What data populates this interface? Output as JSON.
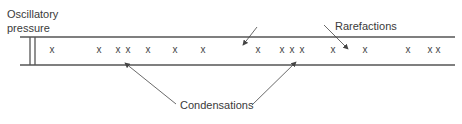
{
  "labels": {
    "source_line1": "Oscillatory",
    "source_line2": "pressure",
    "rarefactions": "Rarefactions",
    "condensations": "Condensations"
  },
  "particles": {
    "glyph": "x",
    "x_positions": [
      52,
      99,
      118,
      128,
      148,
      175,
      203,
      258,
      282,
      292,
      302,
      333,
      365,
      408,
      430,
      438
    ]
  },
  "colors": {
    "line": "#555555",
    "text": "#3a3a3a"
  }
}
